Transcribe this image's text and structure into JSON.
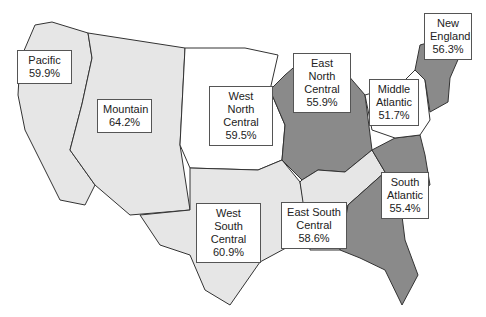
{
  "map": {
    "type": "choropleth",
    "subject": "United States census divisions",
    "colors": {
      "light": "#e6e6e6",
      "white": "#ffffff",
      "dark": "#8a8a8a",
      "medium": "#a9a9a9",
      "border": "#333333"
    },
    "regions": [
      {
        "name": "Pacific",
        "value": "59.9%"
      },
      {
        "name": "Mountain",
        "value": "64.2%"
      },
      {
        "name_line1": "West North",
        "name_line2": "Central",
        "value": "59.5%"
      },
      {
        "name_line1": "East North",
        "name_line2": "Central",
        "value": "55.9%"
      },
      {
        "name_line1": "Middle",
        "name_line2": "Atlantic",
        "value": "51.7%"
      },
      {
        "name_line1": "New",
        "name_line2": "England",
        "value": "56.3%"
      },
      {
        "name_line1": "West South",
        "name_line2": "Central",
        "value": "60.9%"
      },
      {
        "name_line1": "East South",
        "name_line2": "Central",
        "value": "58.6%"
      },
      {
        "name_line1": "South",
        "name_line2": "Atlantic",
        "value": "55.4%"
      }
    ]
  }
}
